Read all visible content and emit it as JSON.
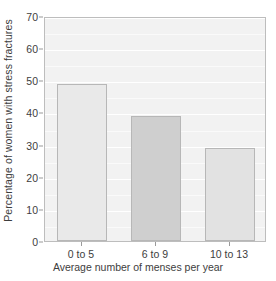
{
  "chart_data": {
    "type": "bar",
    "title": "",
    "subtitle": "",
    "categories": [
      "0 to 5",
      "6 to 9",
      "10 to 13"
    ],
    "values": [
      49,
      39,
      29
    ],
    "xlabel": "Average number of menses per year",
    "ylabel": "Percentage of women with stress fractures",
    "ylim": [
      0,
      70
    ],
    "yticks": [
      0,
      10,
      20,
      30,
      40,
      50,
      60,
      70
    ],
    "ytick_labels": [
      "0",
      "10",
      "20",
      "30",
      "40",
      "50",
      "60",
      "70"
    ],
    "grid": true,
    "legend": "none",
    "bar_colors": [
      "#e9e9e9",
      "#cfcfcf",
      "#e2e2e2"
    ],
    "bar_border_color": "#b7b7b7",
    "panel_background": "#f2f2f2",
    "gridline_color": "#ffffff",
    "axis_text_color": "#3d3d3d"
  }
}
